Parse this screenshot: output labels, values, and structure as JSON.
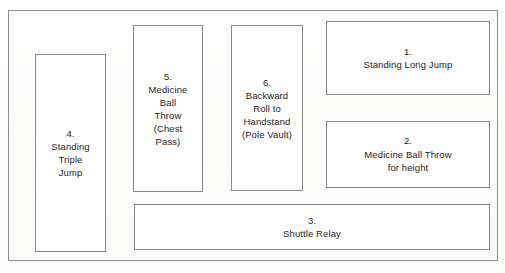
{
  "diagram": {
    "type": "station-layout",
    "frame": {
      "name": "outer-boundary"
    },
    "stations": [
      {
        "id": "station-4",
        "number": "4.",
        "name": "Standing Triple Jump",
        "label": "4.\nStanding\nTriple\nJump"
      },
      {
        "id": "station-5",
        "number": "5.",
        "name": "Medicine Ball Throw (Chest Pass)",
        "label": "5.\nMedicine\nBall\nThrow\n(Chest\nPass)"
      },
      {
        "id": "station-6",
        "number": "6.",
        "name": "Backward Roll to Handstand (Pole Vault)",
        "label": "6.\nBackward\nRoll to\nHandstand\n(Pole Vault)"
      },
      {
        "id": "station-1",
        "number": "1.",
        "name": "Standing Long Jump",
        "label": "1.\nStanding Long Jump"
      },
      {
        "id": "station-2",
        "number": "2.",
        "name": "Medicine Ball Throw for height",
        "label": "2.\nMedicine Ball Throw\nfor height"
      },
      {
        "id": "station-3",
        "number": "3.",
        "name": "Shuttle Relay",
        "label": "3.\nShuttle Relay"
      }
    ],
    "colors": {
      "line": "#85888c",
      "frame_line": "#8d8f92",
      "text": "#1d1d1f",
      "background": "#ffffff"
    }
  }
}
